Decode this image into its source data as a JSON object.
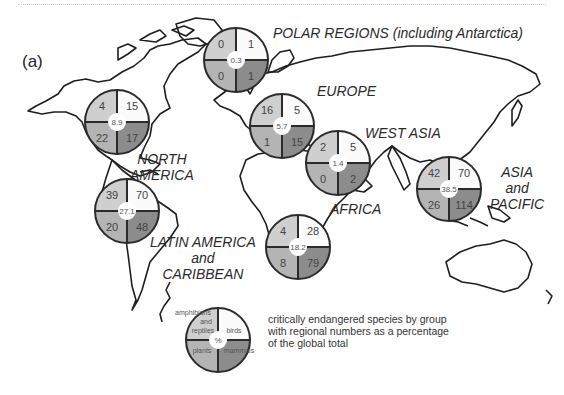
{
  "figure": {
    "panel_label": "(a)",
    "legend_caption_lines": [
      "critically endangered species by group",
      "with regional numbers as a percentage",
      "of the global total"
    ],
    "legend_pie": {
      "top_left": "amphibians and reptiles",
      "top_left_lines": [
        "amphibians",
        "and",
        "reptiles"
      ],
      "top_right": "birds",
      "bottom_left": "plants",
      "bottom_right": "mammals",
      "center": "%"
    },
    "colors": {
      "amphibians_reptiles": "#cfcfcf",
      "birds": "#fbfbfb",
      "plants": "#b4b4b4",
      "mammals": "#8c8c8c",
      "outline": "#2b2b2b",
      "coastline": "#1e1e1e"
    }
  },
  "regions": [
    {
      "name": "POLAR REGIONS (including Antarctica)",
      "label_lines": [
        "POLAR REGIONS (including Antarctica)"
      ],
      "amphibians_reptiles": "0",
      "birds": "1",
      "plants": "0",
      "mammals": "1",
      "percent_global": "0.3"
    },
    {
      "name": "NORTH AMERICA",
      "label_lines": [
        "NORTH",
        "AMERICA"
      ],
      "amphibians_reptiles": "4",
      "birds": "15",
      "plants": "22",
      "mammals": "17",
      "percent_global": "8.9"
    },
    {
      "name": "EUROPE",
      "label_lines": [
        "EUROPE"
      ],
      "amphibians_reptiles": "16",
      "birds": "5",
      "plants": "1",
      "mammals": "15",
      "percent_global": "5.7"
    },
    {
      "name": "WEST ASIA",
      "label_lines": [
        "WEST ASIA"
      ],
      "amphibians_reptiles": "2",
      "birds": "5",
      "plants": "0",
      "mammals": "2",
      "percent_global": "1.4"
    },
    {
      "name": "ASIA and PACIFIC",
      "label_lines": [
        "ASIA",
        "and",
        "PACIFIC"
      ],
      "amphibians_reptiles": "42",
      "birds": "70",
      "plants": "26",
      "mammals": "114",
      "percent_global": "38.5"
    },
    {
      "name": "LATIN AMERICA and CARIBBEAN",
      "label_lines": [
        "LATIN AMERICA",
        "and",
        "CARIBBEAN"
      ],
      "amphibians_reptiles": "39",
      "birds": "70",
      "plants": "20",
      "mammals": "48",
      "percent_global": "27.1"
    },
    {
      "name": "AFRICA",
      "label_lines": [
        "AFRICA"
      ],
      "amphibians_reptiles": "4",
      "birds": "28",
      "plants": "8",
      "mammals": "79",
      "percent_global": "18.2"
    }
  ]
}
